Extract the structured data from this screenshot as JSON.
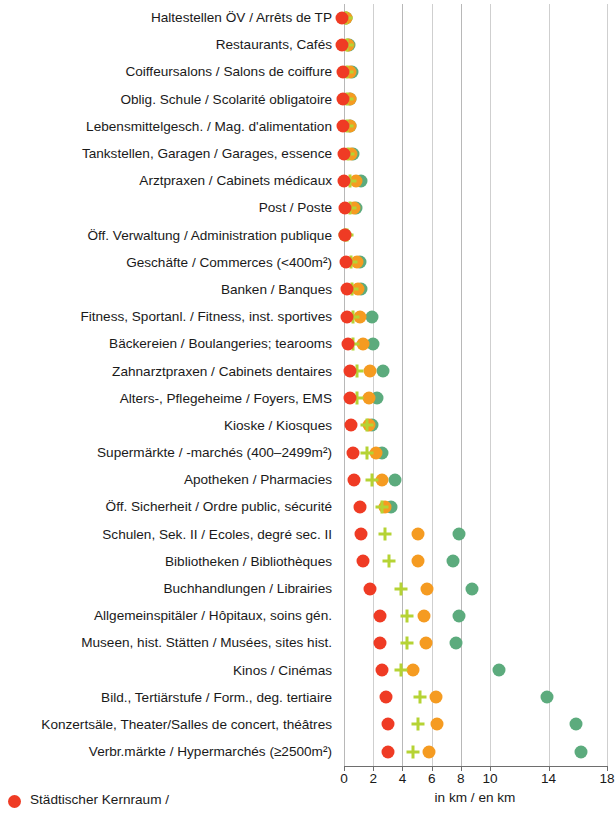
{
  "chart_data": {
    "type": "scatter",
    "title": "",
    "xlabel": "in km / en km",
    "ylabel": "",
    "xlim": [
      0,
      18
    ],
    "grid": true,
    "legend_position": "bottom-left",
    "xticks": [
      0,
      2,
      4,
      6,
      8,
      10,
      14,
      18
    ],
    "xtick_labels": [
      "0",
      "2",
      "4",
      "6",
      "8",
      "10",
      "14",
      "18"
    ],
    "categories": [
      "Haltestellen ÖV / Arrêts de TP",
      "Restaurants, Cafés",
      "Coiffeursalons / Salons de coiffure",
      "Oblig. Schule / Scolarité obligatoire",
      "Lebensmittelgesch. / Mag. d'alimentation",
      "Tankstellen, Garagen / Garages, essence",
      "Arztpraxen / Cabinets médicaux",
      "Post / Poste",
      "Öff. Verwaltung / Administration publique",
      "Geschäfte / Commerces (<400m²)",
      "Banken / Banques",
      "Fitness, Sportanl. / Fitness, inst. sportives",
      "Bäckereien / Boulangeries; tearooms",
      "Zahnarztpraxen / Cabinets dentaires",
      "Alters-, Pflegeheime / Foyers, EMS",
      "Kioske / Kiosques",
      "Supermärkte / -marchés (400–2499m²)",
      "Apotheken / Pharmacies",
      "Öff. Sicherheit / Ordre public, sécurité",
      "Schulen, Sek. II / Ecoles, degré sec. II",
      "Bibliotheken / Bibliothèques",
      "Buchhandlungen / Librairies",
      "Allgemeinspitäler / Hôpitaux, soins gén.",
      "Museen, hist. Stätten / Musées, sites hist.",
      "Kinos / Cinémas",
      "Bild., Tertiärstufe / Form., deg. tertiaire",
      "Konzertsäle, Theater/Salles de concert, théâtres",
      "Verbr.märkte / Hypermarchés (≥2500m²)"
    ],
    "series": [
      {
        "name": "Städtischer Kernraum /",
        "marker": "circle",
        "color": "#ef3b24",
        "values": [
          0.25,
          0.3,
          0.35,
          0.35,
          0.35,
          0.4,
          0.4,
          0.45,
          0.5,
          0.55,
          0.6,
          0.65,
          0.7,
          0.8,
          0.8,
          0.9,
          1.0,
          1.1,
          1.5,
          1.6,
          1.7,
          2.2,
          2.9,
          2.9,
          3.0,
          3.3,
          3.4,
          3.4
        ]
      },
      {
        "name": "cross-series",
        "marker": "cross",
        "color": "#b5d334",
        "values": [
          0.55,
          0.6,
          0.6,
          0.65,
          0.65,
          0.7,
          0.8,
          0.85,
          0.6,
          0.9,
          0.95,
          1.0,
          1.05,
          1.3,
          1.3,
          2.0,
          2.0,
          2.3,
          3.0,
          3.2,
          3.5,
          4.3,
          4.7,
          4.7,
          4.3,
          5.6,
          5.5,
          5.1
        ]
      },
      {
        "name": "orange-series",
        "marker": "circle",
        "color": "#f59b21",
        "values": [
          0.55,
          0.7,
          0.85,
          0.8,
          0.8,
          0.9,
          1.25,
          1.1,
          0.5,
          1.3,
          1.4,
          1.5,
          1.7,
          2.2,
          2.1,
          2.1,
          2.6,
          3.0,
          3.2,
          5.5,
          5.5,
          6.1,
          5.9,
          6.0,
          5.1,
          6.7,
          6.8,
          6.2
        ]
      },
      {
        "name": "green-series",
        "marker": "circle",
        "color": "#5cab7d",
        "values": [
          0.55,
          0.75,
          0.95,
          0.85,
          0.85,
          1.0,
          1.6,
          1.25,
          0.5,
          1.5,
          1.6,
          2.3,
          2.4,
          3.1,
          2.7,
          2.3,
          3.0,
          3.9,
          3.6,
          8.3,
          7.9,
          9.2,
          8.3,
          8.1,
          11.0,
          14.3,
          16.3,
          16.6
        ]
      }
    ]
  },
  "legend": {
    "items": [
      {
        "label": "Städtischer Kernraum /",
        "color": "#ef3b24"
      }
    ]
  },
  "axis": {
    "unit_label": "in km / en km"
  }
}
